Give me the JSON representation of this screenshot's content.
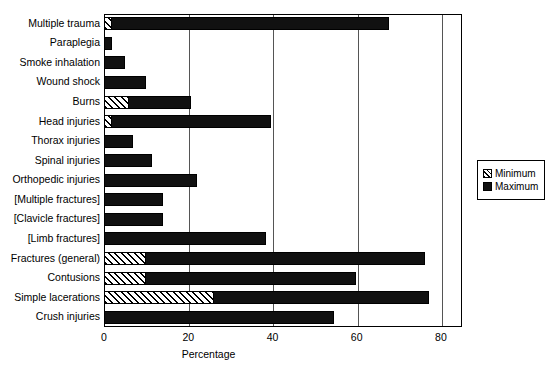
{
  "chart_data": {
    "type": "bar",
    "orientation": "horizontal",
    "title": "",
    "xlabel": "Percentage",
    "ylabel": "",
    "xlim": [
      0,
      85
    ],
    "xticks": [
      0,
      20,
      40,
      60,
      80
    ],
    "xtick_labels": [
      "0",
      "20",
      "40",
      "60",
      "80"
    ],
    "grid": true,
    "legend_position": "right",
    "categories": [
      "Multiple trauma",
      "Paraplegia",
      "Smoke inhalation",
      "Wound shock",
      "Burns",
      "Head injuries",
      "Thorax injuries",
      "Spinal injuries",
      "Orthopedic injuries",
      "[Multiple fractures]",
      "[Clavicle fractures]",
      "[Limb fractures]",
      "Fractures (general)",
      "Contusions",
      "Simple lacerations",
      "Crush injuries"
    ],
    "series": [
      {
        "name": "Minimum",
        "fill": "hatched",
        "values": [
          2,
          0,
          0,
          0,
          6,
          2,
          0,
          0,
          0,
          0,
          0,
          0,
          10,
          10,
          26,
          0
        ]
      },
      {
        "name": "Maximum",
        "fill": "solid-black",
        "values": [
          68,
          2,
          5,
          10,
          21,
          40,
          7,
          11.5,
          22,
          14,
          14,
          38.5,
          76.5,
          60,
          77.5,
          54.5
        ]
      }
    ]
  },
  "legend": {
    "items": [
      {
        "label": "Minimum",
        "swatch": "hatched-swatch"
      },
      {
        "label": "Maximum",
        "swatch": "solid-black-swatch"
      }
    ]
  }
}
